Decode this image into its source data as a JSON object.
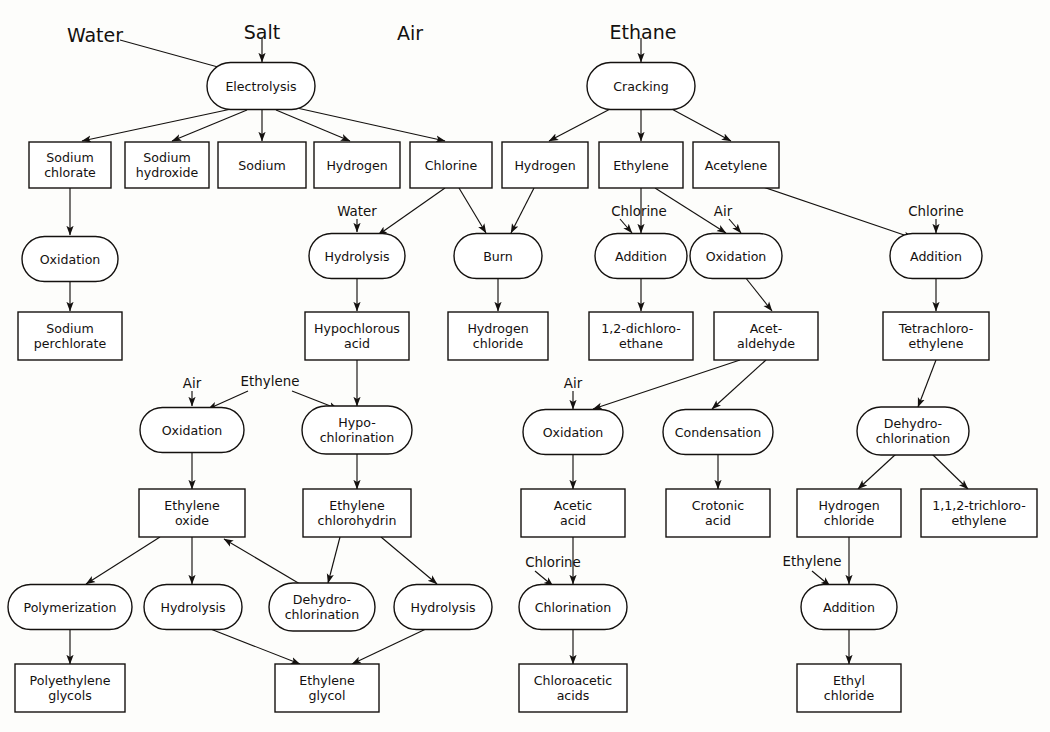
{
  "diagram": {
    "colors": {
      "line": "#14110f",
      "box_fill": "#ffffff",
      "background": "#fdfdfb"
    },
    "top_feeds": [
      {
        "id": "water_top",
        "label": "Water",
        "x": 95,
        "y": 28
      },
      {
        "id": "salt_top",
        "label": "Salt",
        "x": 262,
        "y": 25
      },
      {
        "id": "air_top",
        "label": "Air",
        "x": 410,
        "y": 26
      },
      {
        "id": "ethane_top",
        "label": "Ethane",
        "x": 643,
        "y": 25
      }
    ],
    "feed_labels": [
      {
        "id": "water_hydrolysis",
        "label": "Water",
        "x": 357,
        "y": 211
      },
      {
        "id": "chlorine_addition1",
        "label": "Chlorine",
        "x": 639,
        "y": 211
      },
      {
        "id": "air_oxidation1",
        "label": "Air",
        "x": 723,
        "y": 211
      },
      {
        "id": "chlorine_addition2",
        "label": "Chlorine",
        "x": 936,
        "y": 211
      },
      {
        "id": "air_oxidation_eo",
        "label": "Air",
        "x": 192,
        "y": 383
      },
      {
        "id": "ethylene_oxide_feed",
        "label": "Ethylene",
        "x": 270,
        "y": 381
      },
      {
        "id": "air_oxidation_ac",
        "label": "Air",
        "x": 573,
        "y": 383
      },
      {
        "id": "chlorine_chlorin",
        "label": "Chlorine",
        "x": 553,
        "y": 562
      },
      {
        "id": "ethylene_add_ec",
        "label": "Ethylene",
        "x": 812,
        "y": 561
      }
    ],
    "ovals": [
      {
        "id": "electrolysis",
        "lines": [
          "Electrolysis"
        ],
        "cx": 261,
        "cy": 86,
        "w": 108,
        "h": 47
      },
      {
        "id": "cracking",
        "lines": [
          "Cracking"
        ],
        "cx": 641,
        "cy": 86,
        "w": 108,
        "h": 47
      },
      {
        "id": "oxidation_chlorate",
        "lines": [
          "Oxidation"
        ],
        "cx": 70,
        "cy": 259,
        "w": 96,
        "h": 45
      },
      {
        "id": "hydrolysis_hocl",
        "lines": [
          "Hydrolysis"
        ],
        "cx": 357,
        "cy": 256,
        "w": 96,
        "h": 45
      },
      {
        "id": "burn",
        "lines": [
          "Burn"
        ],
        "cx": 498,
        "cy": 256,
        "w": 88,
        "h": 45
      },
      {
        "id": "addition_dce",
        "lines": [
          "Addition"
        ],
        "cx": 641,
        "cy": 256,
        "w": 92,
        "h": 45
      },
      {
        "id": "oxidation_acet",
        "lines": [
          "Oxidation"
        ],
        "cx": 736,
        "cy": 256,
        "w": 92,
        "h": 45
      },
      {
        "id": "addition_tetra",
        "lines": [
          "Addition"
        ],
        "cx": 936,
        "cy": 256,
        "w": 92,
        "h": 45
      },
      {
        "id": "oxidation_eo",
        "lines": [
          "Oxidation"
        ],
        "cx": 192,
        "cy": 430,
        "w": 104,
        "h": 45
      },
      {
        "id": "hypochlorination",
        "lines": [
          "Hypo-",
          "chlorination"
        ],
        "cx": 357,
        "cy": 430,
        "w": 110,
        "h": 48
      },
      {
        "id": "oxidation_acetic",
        "lines": [
          "Oxidation"
        ],
        "cx": 573,
        "cy": 432,
        "w": 100,
        "h": 45
      },
      {
        "id": "condensation",
        "lines": [
          "Condensation"
        ],
        "cx": 718,
        "cy": 432,
        "w": 110,
        "h": 45
      },
      {
        "id": "dehydro_tce",
        "lines": [
          "Dehydro-",
          "chlorination"
        ],
        "cx": 913,
        "cy": 431,
        "w": 112,
        "h": 48
      },
      {
        "id": "polymerization",
        "lines": [
          "Polymerization"
        ],
        "cx": 70,
        "cy": 607,
        "w": 124,
        "h": 45
      },
      {
        "id": "hydrolysis_eg1",
        "lines": [
          "Hydrolysis"
        ],
        "cx": 193,
        "cy": 607,
        "w": 98,
        "h": 45
      },
      {
        "id": "dehydro_eo",
        "lines": [
          "Dehydro-",
          "chlorination"
        ],
        "cx": 322,
        "cy": 607,
        "w": 106,
        "h": 48
      },
      {
        "id": "hydrolysis_eg2",
        "lines": [
          "Hydrolysis"
        ],
        "cx": 443,
        "cy": 607,
        "w": 98,
        "h": 45
      },
      {
        "id": "chlorination",
        "lines": [
          "Chlorination"
        ],
        "cx": 573,
        "cy": 607,
        "w": 108,
        "h": 45
      },
      {
        "id": "addition_ethylcl",
        "lines": [
          "Addition"
        ],
        "cx": 849,
        "cy": 607,
        "w": 96,
        "h": 45
      }
    ],
    "boxes": [
      {
        "id": "sodium_chlorate",
        "lines": [
          "Sodium",
          "chlorate"
        ],
        "cx": 70,
        "cy": 165,
        "w": 82,
        "h": 46
      },
      {
        "id": "sodium_hydroxide",
        "lines": [
          "Sodium",
          "hydroxide"
        ],
        "cx": 167,
        "cy": 165,
        "w": 84,
        "h": 46
      },
      {
        "id": "sodium",
        "lines": [
          "Sodium"
        ],
        "cx": 262,
        "cy": 165,
        "w": 88,
        "h": 46
      },
      {
        "id": "hydrogen_electro",
        "lines": [
          "Hydrogen"
        ],
        "cx": 357,
        "cy": 165,
        "w": 86,
        "h": 46
      },
      {
        "id": "chlorine",
        "lines": [
          "Chlorine"
        ],
        "cx": 451,
        "cy": 165,
        "w": 82,
        "h": 46
      },
      {
        "id": "hydrogen_crack",
        "lines": [
          "Hydrogen"
        ],
        "cx": 545,
        "cy": 165,
        "w": 86,
        "h": 46
      },
      {
        "id": "ethylene",
        "lines": [
          "Ethylene"
        ],
        "cx": 641,
        "cy": 165,
        "w": 84,
        "h": 46
      },
      {
        "id": "acetylene",
        "lines": [
          "Acetylene"
        ],
        "cx": 736,
        "cy": 165,
        "w": 86,
        "h": 46
      },
      {
        "id": "sodium_perchlorate",
        "lines": [
          "Sodium",
          "perchlorate"
        ],
        "cx": 70,
        "cy": 336,
        "w": 104,
        "h": 48
      },
      {
        "id": "hypochlorous_acid",
        "lines": [
          "Hypochlorous",
          "acid"
        ],
        "cx": 357,
        "cy": 336,
        "w": 104,
        "h": 48
      },
      {
        "id": "hydrogen_chloride",
        "lines": [
          "Hydrogen",
          "chloride"
        ],
        "cx": 498,
        "cy": 336,
        "w": 100,
        "h": 48
      },
      {
        "id": "dichloroethane",
        "lines": [
          "1,2-dichloro-",
          "ethane"
        ],
        "cx": 641,
        "cy": 336,
        "w": 104,
        "h": 48
      },
      {
        "id": "acetaldehyde",
        "lines": [
          "Acet-",
          "aldehyde"
        ],
        "cx": 766,
        "cy": 336,
        "w": 104,
        "h": 48
      },
      {
        "id": "tetrachloroethylene",
        "lines": [
          "Tetrachloro-",
          "ethylene"
        ],
        "cx": 936,
        "cy": 336,
        "w": 106,
        "h": 48
      },
      {
        "id": "ethylene_oxide",
        "lines": [
          "Ethylene",
          "oxide"
        ],
        "cx": 192,
        "cy": 513,
        "w": 106,
        "h": 48
      },
      {
        "id": "ethylene_chlorohydrin",
        "lines": [
          "Ethylene",
          "chlorohydrin"
        ],
        "cx": 357,
        "cy": 513,
        "w": 108,
        "h": 48
      },
      {
        "id": "acetic_acid",
        "lines": [
          "Acetic",
          "acid"
        ],
        "cx": 573,
        "cy": 513,
        "w": 104,
        "h": 48
      },
      {
        "id": "crotonic_acid",
        "lines": [
          "Crotonic",
          "acid"
        ],
        "cx": 718,
        "cy": 513,
        "w": 104,
        "h": 48
      },
      {
        "id": "hydrogen_chloride2",
        "lines": [
          "Hydrogen",
          "chloride"
        ],
        "cx": 849,
        "cy": 513,
        "w": 104,
        "h": 48
      },
      {
        "id": "trichloroethylene",
        "lines": [
          "1,1,2-trichloro-",
          "ethylene"
        ],
        "cx": 979,
        "cy": 513,
        "w": 116,
        "h": 48
      },
      {
        "id": "polyethylene_glycols",
        "lines": [
          "Polyethylene",
          "glycols"
        ],
        "cx": 70,
        "cy": 688,
        "w": 110,
        "h": 48
      },
      {
        "id": "ethylene_glycol",
        "lines": [
          "Ethylene",
          "glycol"
        ],
        "cx": 327,
        "cy": 688,
        "w": 104,
        "h": 48
      },
      {
        "id": "chloroacetic_acids",
        "lines": [
          "Chloroacetic",
          "acids"
        ],
        "cx": 573,
        "cy": 688,
        "w": 108,
        "h": 48
      },
      {
        "id": "ethyl_chloride",
        "lines": [
          "Ethyl",
          "chloride"
        ],
        "cx": 849,
        "cy": 688,
        "w": 104,
        "h": 48
      }
    ],
    "edges": [
      {
        "from": "water_top",
        "to": "electrolysis",
        "x1": 120,
        "y1": 40,
        "x2": 236,
        "y2": 72
      },
      {
        "from": "salt_top",
        "to": "electrolysis",
        "x1": 262,
        "y1": 38,
        "x2": 262,
        "y2": 62
      },
      {
        "from": "ethane_top",
        "to": "cracking",
        "x1": 641,
        "y1": 38,
        "x2": 641,
        "y2": 62
      },
      {
        "from": "electrolysis",
        "to": "sodium_chlorate",
        "x1": 236,
        "y1": 108,
        "x2": 82,
        "y2": 141
      },
      {
        "from": "electrolysis",
        "to": "sodium_hydroxide",
        "x1": 247,
        "y1": 110,
        "x2": 172,
        "y2": 141
      },
      {
        "from": "electrolysis",
        "to": "sodium",
        "x1": 262,
        "y1": 110,
        "x2": 262,
        "y2": 141
      },
      {
        "from": "electrolysis",
        "to": "hydrogen_electro",
        "x1": 276,
        "y1": 110,
        "x2": 350,
        "y2": 141
      },
      {
        "from": "electrolysis",
        "to": "chlorine",
        "x1": 288,
        "y1": 106,
        "x2": 445,
        "y2": 141
      },
      {
        "from": "cracking",
        "to": "hydrogen_crack",
        "x1": 614,
        "y1": 107,
        "x2": 549,
        "y2": 141
      },
      {
        "from": "cracking",
        "to": "ethylene",
        "x1": 641,
        "y1": 110,
        "x2": 641,
        "y2": 141
      },
      {
        "from": "cracking",
        "to": "acetylene",
        "x1": 668,
        "y1": 107,
        "x2": 731,
        "y2": 141
      },
      {
        "from": "sodium_chlorate",
        "to": "oxidation_chlorate",
        "x1": 70,
        "y1": 188,
        "x2": 70,
        "y2": 235
      },
      {
        "from": "oxidation_chlorate",
        "to": "sodium_perchlorate",
        "x1": 70,
        "y1": 282,
        "x2": 70,
        "y2": 311
      },
      {
        "from": "water_hydrolysis",
        "to": "hydrolysis_hocl",
        "x1": 357,
        "y1": 219,
        "x2": 357,
        "y2": 232
      },
      {
        "from": "chlorine",
        "to": "hydrolysis_hocl",
        "x1": 445,
        "y1": 188,
        "x2": 378,
        "y2": 235
      },
      {
        "from": "chlorine",
        "to": "burn",
        "x1": 459,
        "y1": 188,
        "x2": 486,
        "y2": 233
      },
      {
        "from": "hydrogen_crack",
        "to": "burn",
        "x1": 534,
        "y1": 188,
        "x2": 511,
        "y2": 233
      },
      {
        "from": "hydrolysis_hocl",
        "to": "hypochlorous_acid",
        "x1": 357,
        "y1": 279,
        "x2": 357,
        "y2": 311
      },
      {
        "from": "burn",
        "to": "hydrogen_chloride",
        "x1": 498,
        "y1": 279,
        "x2": 498,
        "y2": 311
      },
      {
        "from": "chlorine_addition1",
        "to": "addition_dce",
        "x1": 620,
        "y1": 219,
        "x2": 632,
        "y2": 233
      },
      {
        "from": "ethylene",
        "to": "addition_dce",
        "x1": 641,
        "y1": 188,
        "x2": 641,
        "y2": 233
      },
      {
        "from": "ethylene",
        "to": "oxidation_acet",
        "x1": 655,
        "y1": 188,
        "x2": 726,
        "y2": 233
      },
      {
        "from": "air_oxidation1",
        "to": "oxidation_acet",
        "x1": 729,
        "y1": 219,
        "x2": 741,
        "y2": 233
      },
      {
        "from": "acetylene",
        "to": "addition_tetra",
        "x1": 760,
        "y1": 186,
        "x2": 913,
        "y2": 238
      },
      {
        "from": "chlorine_addition2",
        "to": "addition_tetra",
        "x1": 936,
        "y1": 219,
        "x2": 936,
        "y2": 233
      },
      {
        "from": "addition_dce",
        "to": "dichloroethane",
        "x1": 641,
        "y1": 279,
        "x2": 641,
        "y2": 311
      },
      {
        "from": "oxidation_acet",
        "to": "acetaldehyde",
        "x1": 745,
        "y1": 277,
        "x2": 772,
        "y2": 311
      },
      {
        "from": "addition_tetra",
        "to": "tetrachloroethylene",
        "x1": 936,
        "y1": 279,
        "x2": 936,
        "y2": 311
      },
      {
        "from": "air_oxidation_eo",
        "to": "oxidation_eo",
        "x1": 192,
        "y1": 391,
        "x2": 192,
        "y2": 406
      },
      {
        "from": "ethylene_oxide_feed",
        "to": "oxidation_eo",
        "x1": 248,
        "y1": 391,
        "x2": 208,
        "y2": 409
      },
      {
        "from": "ethylene_oxide_feed",
        "to": "hypochlorination",
        "x1": 292,
        "y1": 391,
        "x2": 338,
        "y2": 409
      },
      {
        "from": "hypochlorous_acid",
        "to": "hypochlorination",
        "x1": 357,
        "y1": 360,
        "x2": 357,
        "y2": 406
      },
      {
        "from": "oxidation_eo",
        "to": "ethylene_oxide",
        "x1": 192,
        "y1": 453,
        "x2": 192,
        "y2": 489
      },
      {
        "from": "hypochlorination",
        "to": "ethylene_chlorohydrin",
        "x1": 357,
        "y1": 454,
        "x2": 357,
        "y2": 489
      },
      {
        "from": "air_oxidation_ac",
        "to": "oxidation_acetic",
        "x1": 573,
        "y1": 391,
        "x2": 573,
        "y2": 409
      },
      {
        "from": "acetaldehyde",
        "to": "oxidation_acetic",
        "x1": 740,
        "y1": 360,
        "x2": 593,
        "y2": 409
      },
      {
        "from": "acetaldehyde",
        "to": "condensation",
        "x1": 766,
        "y1": 360,
        "x2": 712,
        "y2": 409
      },
      {
        "from": "oxidation_acetic",
        "to": "acetic_acid",
        "x1": 573,
        "y1": 455,
        "x2": 573,
        "y2": 489
      },
      {
        "from": "condensation",
        "to": "crotonic_acid",
        "x1": 718,
        "y1": 455,
        "x2": 718,
        "y2": 489
      },
      {
        "from": "tetrachloroethylene",
        "to": "dehydro_tce",
        "x1": 936,
        "y1": 360,
        "x2": 918,
        "y2": 407
      },
      {
        "from": "dehydro_tce",
        "to": "hydrogen_chloride2",
        "x1": 896,
        "y1": 454,
        "x2": 858,
        "y2": 489
      },
      {
        "from": "dehydro_tce",
        "to": "trichloroethylene",
        "x1": 932,
        "y1": 454,
        "x2": 968,
        "y2": 489
      },
      {
        "from": "ethylene_oxide",
        "to": "polymerization",
        "x1": 160,
        "y1": 537,
        "x2": 86,
        "y2": 584
      },
      {
        "from": "ethylene_oxide",
        "to": "hydrolysis_eg1",
        "x1": 192,
        "y1": 537,
        "x2": 192,
        "y2": 584
      },
      {
        "from": "dehydro_eo",
        "to": "ethylene_oxide",
        "x1": 300,
        "y1": 584,
        "x2": 224,
        "y2": 539
      },
      {
        "from": "ethylene_chlorohydrin",
        "to": "dehydro_eo",
        "x1": 340,
        "y1": 537,
        "x2": 328,
        "y2": 583
      },
      {
        "from": "ethylene_chlorohydrin",
        "to": "hydrolysis_eg2",
        "x1": 381,
        "y1": 537,
        "x2": 437,
        "y2": 584
      },
      {
        "from": "hydrolysis_eg1",
        "to": "ethylene_glycol",
        "x1": 208,
        "y1": 628,
        "x2": 300,
        "y2": 664
      },
      {
        "from": "hydrolysis_eg2",
        "to": "ethylene_glycol",
        "x1": 428,
        "y1": 628,
        "x2": 352,
        "y2": 664
      },
      {
        "from": "polymerization",
        "to": "polyethylene_glycols",
        "x1": 70,
        "y1": 630,
        "x2": 70,
        "y2": 664
      },
      {
        "from": "acetic_acid",
        "to": "chlorination",
        "x1": 573,
        "y1": 537,
        "x2": 573,
        "y2": 584
      },
      {
        "from": "chlorine_chlorin",
        "to": "chlorination",
        "x1": 535,
        "y1": 571,
        "x2": 553,
        "y2": 586
      },
      {
        "from": "chlorination",
        "to": "chloroacetic_acids",
        "x1": 573,
        "y1": 630,
        "x2": 573,
        "y2": 664
      },
      {
        "from": "hydrogen_chloride2",
        "to": "addition_ethylcl",
        "x1": 849,
        "y1": 537,
        "x2": 849,
        "y2": 584
      },
      {
        "from": "ethylene_add_ec",
        "to": "addition_ethylcl",
        "x1": 812,
        "y1": 571,
        "x2": 830,
        "y2": 586
      },
      {
        "from": "addition_ethylcl",
        "to": "ethyl_chloride",
        "x1": 849,
        "y1": 630,
        "x2": 849,
        "y2": 664
      }
    ]
  }
}
